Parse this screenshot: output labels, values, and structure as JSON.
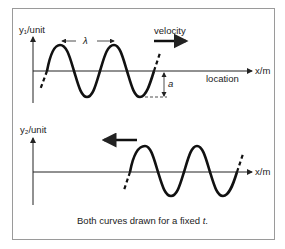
{
  "figure": {
    "panel1": {
      "y_label": "y₁/unit",
      "x_label": "x/m",
      "axis_caption": "location",
      "wavelength_label": "λ",
      "amplitude_label": "a",
      "direction_label": "velocity",
      "direction": "right"
    },
    "panel2": {
      "y_label": "y₂/unit",
      "x_label": "x/m",
      "direction": "left"
    },
    "caption_prefix": "Both curves drawn for a fixed ",
    "caption_var": "t",
    "caption_suffix": "."
  }
}
